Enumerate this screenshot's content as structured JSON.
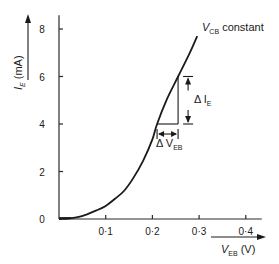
{
  "chart_data": {
    "type": "line",
    "title": "",
    "xlabel": "V_EB (V)",
    "xlabel_main": "V",
    "xlabel_sub": "EB",
    "xlabel_unit": "(V)",
    "ylabel": "I_E (mA)",
    "ylabel_main": "I",
    "ylabel_sub": "E",
    "ylabel_unit": "(mA)",
    "xlim": [
      0,
      0.43
    ],
    "ylim": [
      0,
      8.5
    ],
    "x_ticks": [
      0.1,
      0.2,
      0.3,
      0.4
    ],
    "x_tick_labels": [
      "0·1",
      "0·2",
      "0·3",
      "0·4"
    ],
    "y_ticks": [
      0,
      2,
      4,
      6,
      8
    ],
    "y_tick_labels": [
      "0",
      "2",
      "4",
      "6",
      "8"
    ],
    "grid": false,
    "series": [
      {
        "name": "V_CB constant",
        "label_main": "V",
        "label_sub": "CB",
        "label_rest": " constant",
        "x": [
          0,
          0.02,
          0.04,
          0.06,
          0.08,
          0.1,
          0.12,
          0.14,
          0.16,
          0.18,
          0.2,
          0.21,
          0.23,
          0.255,
          0.28,
          0.296
        ],
        "y": [
          0,
          0.02,
          0.08,
          0.2,
          0.36,
          0.55,
          0.85,
          1.2,
          1.75,
          2.45,
          3.35,
          4.0,
          5.0,
          6.0,
          7.0,
          7.7
        ]
      }
    ],
    "annotations": {
      "delta_ie": {
        "label_main": "Δ I",
        "label_sub": "E",
        "from_y": 4,
        "to_y": 6,
        "x": 0.255
      },
      "delta_veb": {
        "label_main": "Δ V",
        "label_sub": "EB",
        "from_x": 0.21,
        "to_x": 0.255,
        "y": 4
      }
    }
  }
}
